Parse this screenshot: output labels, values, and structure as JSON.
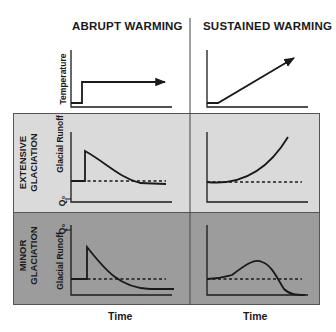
{
  "columns": [
    {
      "title": "ABRUPT WARMING"
    },
    {
      "title": "SUSTAINED WARMING"
    }
  ],
  "rows": {
    "temperature": {
      "ylabel": "Temperature"
    },
    "extensive": {
      "label_line1": "EXTENSIVE",
      "label_line2": "GLACIATION",
      "ylabel": "Glacial Runoff",
      "baseline_label": "Q₀",
      "background": "#dadada"
    },
    "minor": {
      "label_line1": "MINOR",
      "label_line2": "GLACIATION",
      "ylabel": "Glacial Runoff",
      "baseline_label": "Q₀",
      "background": "#9c9c9c"
    }
  },
  "xlabel": "Time",
  "panels": [
    {
      "row": "temperature",
      "col": "abrupt",
      "description": "Step increase in temperature then constant (arrow)"
    },
    {
      "row": "temperature",
      "col": "sustained",
      "description": "Flat then linear increase in temperature (arrow)"
    },
    {
      "row": "extensive",
      "col": "abrupt",
      "description": "Runoff jumps up then decays below baseline"
    },
    {
      "row": "extensive",
      "col": "sustained",
      "description": "Runoff rises continuously above baseline"
    },
    {
      "row": "minor",
      "col": "abrupt",
      "description": "Runoff jumps up then decays below baseline"
    },
    {
      "row": "minor",
      "col": "sustained",
      "description": "Runoff rises to a peak, then falls below baseline"
    }
  ]
}
